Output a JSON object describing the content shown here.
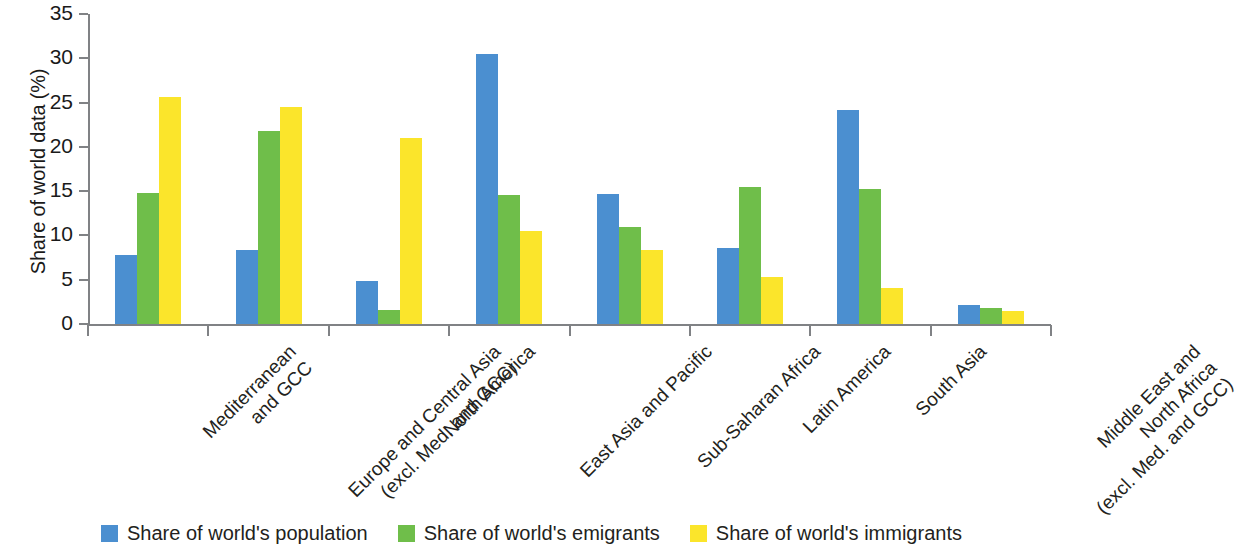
{
  "chart_data": {
    "type": "bar",
    "title": "",
    "xlabel": "",
    "ylabel": "Share of world data (%)",
    "ylim": [
      0,
      35
    ],
    "yticks": [
      0,
      5,
      10,
      15,
      20,
      25,
      30,
      35
    ],
    "grid": false,
    "legend_position": "bottom",
    "categories": [
      "Mediterranean\nand GCC",
      "Europe and Central Asia\n(excl. Med. and GCC)",
      "North America",
      "East Asia and Pacific",
      "Sub-Saharan Africa",
      "Latin America",
      "South Asia",
      "Middle East and\nNorth Africa\n(excl. Med. and GCC)"
    ],
    "category_lines": [
      [
        "Mediterranean",
        "and GCC"
      ],
      [
        "Europe and Central Asia",
        "(excl. Med. and GCC)"
      ],
      [
        "North America"
      ],
      [
        "East Asia and Pacific"
      ],
      [
        "Sub-Saharan Africa"
      ],
      [
        "Latin America"
      ],
      [
        "South Asia"
      ],
      [
        "Middle East and",
        "North Africa",
        "(excl. Med. and GCC)"
      ]
    ],
    "series": [
      {
        "name": "Share of world's population",
        "color": "#4B8FD0",
        "values": [
          7.8,
          8.4,
          4.9,
          30.5,
          14.7,
          8.6,
          24.2,
          2.2
        ]
      },
      {
        "name": "Share of world's emigrants",
        "color": "#6FBE4A",
        "values": [
          14.8,
          21.8,
          1.6,
          14.6,
          11.0,
          15.5,
          15.2,
          1.8
        ]
      },
      {
        "name": "Share of world's immigrants",
        "color": "#FBE52B",
        "values": [
          25.6,
          24.5,
          21.0,
          10.5,
          8.4,
          5.3,
          4.1,
          1.5
        ]
      }
    ]
  },
  "axis": {
    "y_title": "Share of world data (%)",
    "y_tick_labels": [
      "0",
      "5",
      "10",
      "15",
      "20",
      "25",
      "30",
      "35"
    ]
  },
  "legend": {
    "items": [
      {
        "label": "Share of world's population",
        "color": "#4B8FD0"
      },
      {
        "label": "Share of world's emigrants",
        "color": "#6FBE4A"
      },
      {
        "label": "Share of world's immigrants",
        "color": "#FBE52B"
      }
    ]
  },
  "colors": {
    "axis": "#808285",
    "text": "#231f20",
    "background": "#ffffff"
  }
}
